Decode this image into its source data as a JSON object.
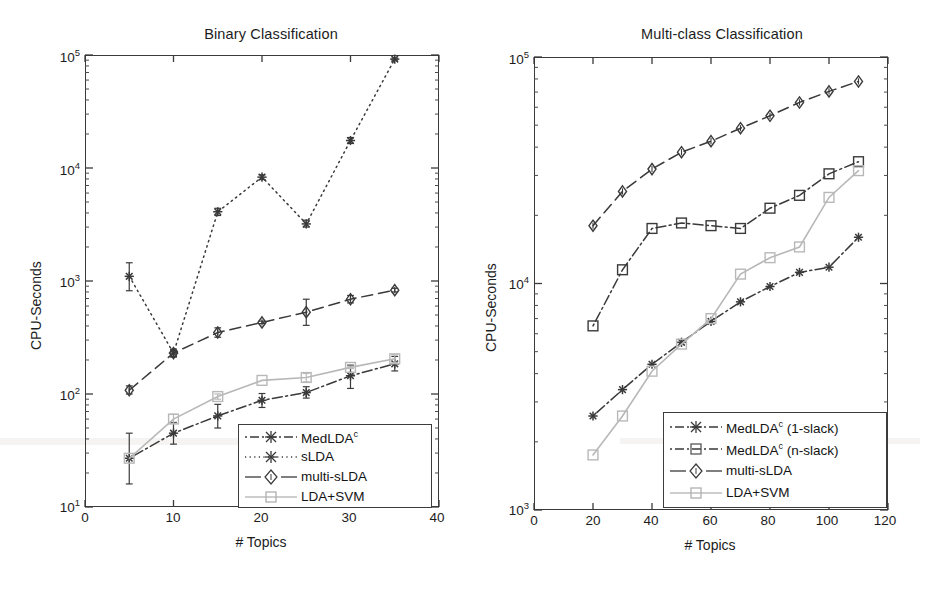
{
  "figure": {
    "background": "#ffffff",
    "ink": "#1a1a1a"
  },
  "panels": [
    {
      "id": "binary",
      "title": "Binary Classification",
      "xlabel": "# Topics",
      "ylabel": "CPU-Seconds",
      "xticks": [
        "0",
        "10",
        "20",
        "30",
        "40"
      ],
      "ytick_mantissa": [
        "10",
        "10",
        "10",
        "10",
        "10"
      ],
      "yticks_exp": [
        "1",
        "2",
        "3",
        "4",
        "5"
      ],
      "legend": [
        {
          "label": "MedLDA",
          "sup": "c",
          "style": "dashdot-asterisk",
          "color": "#3a3a3a"
        },
        {
          "label": "sLDA",
          "sup": "",
          "style": "dotted-asterisk",
          "color": "#3a3a3a"
        },
        {
          "label": "multi-sLDA",
          "sup": "",
          "style": "dashed-diamond",
          "color": "#3a3a3a"
        },
        {
          "label": "LDA+SVM",
          "sup": "",
          "style": "solid-square",
          "color": "#b8b8b8"
        }
      ]
    },
    {
      "id": "multiclass",
      "title": "Multi-class Classification",
      "xlabel": "# Topics",
      "ylabel": "CPU-Seconds",
      "xticks": [
        "0",
        "20",
        "40",
        "60",
        "80",
        "100",
        "120"
      ],
      "ytick_mantissa": [
        "10",
        "10",
        "10"
      ],
      "yticks_exp": [
        "3",
        "4",
        "5"
      ],
      "legend": [
        {
          "label": "MedLDA",
          "sup": "c",
          "suffix": " (1-slack)",
          "style": "dashdot-asterisk",
          "color": "#3a3a3a"
        },
        {
          "label": "MedLDA",
          "sup": "c",
          "suffix": " (n-slack)",
          "style": "dashdot-square",
          "color": "#3a3a3a"
        },
        {
          "label": "multi-sLDA",
          "sup": "",
          "suffix": "",
          "style": "dashed-diamond",
          "color": "#3a3a3a"
        },
        {
          "label": "LDA+SVM",
          "sup": "",
          "suffix": "",
          "style": "solid-square",
          "color": "#b8b8b8"
        }
      ]
    }
  ],
  "chart_data": [
    {
      "type": "line",
      "title": "Binary Classification",
      "xlabel": "# Topics",
      "ylabel": "CPU-Seconds",
      "yscale": "log",
      "xlim": [
        0,
        40
      ],
      "ylim": [
        10,
        100000
      ],
      "xticks": [
        0,
        10,
        20,
        30,
        40
      ],
      "yticks": [
        10,
        100,
        1000,
        10000,
        100000
      ],
      "grid": false,
      "legend_position": "lower-right-inside",
      "x": [
        5,
        10,
        15,
        20,
        25,
        30,
        35
      ],
      "series": [
        {
          "name": "MedLDA^c",
          "marker": "asterisk",
          "linestyle": "dashdot",
          "color": "#3a3a3a",
          "values": [
            27,
            45,
            64,
            88,
            103,
            145,
            185
          ],
          "err_low": [
            16,
            36,
            50,
            76,
            92,
            112,
            160
          ],
          "err_high": [
            45,
            56,
            81,
            101,
            116,
            180,
            215
          ]
        },
        {
          "name": "sLDA",
          "marker": "asterisk",
          "linestyle": "dotted",
          "color": "#3a3a3a",
          "values": [
            1100,
            230,
            4100,
            8300,
            3200,
            17500,
            92000
          ],
          "err_low": [
            820,
            215,
            3800,
            7900,
            3000,
            16500,
            90000
          ],
          "err_high": [
            1450,
            245,
            4400,
            8700,
            3450,
            18600,
            94000
          ]
        },
        {
          "name": "multi-sLDA",
          "marker": "diamond",
          "linestyle": "dashed",
          "color": "#3a3a3a",
          "values": [
            108,
            230,
            350,
            430,
            530,
            690,
            830
          ],
          "err_low": [
            100,
            212,
            318,
            420,
            405,
            640,
            800
          ],
          "err_high": [
            118,
            250,
            385,
            442,
            690,
            745,
            862
          ]
        },
        {
          "name": "LDA+SVM",
          "marker": "square",
          "linestyle": "solid",
          "color": "#b8b8b8",
          "values": [
            27,
            60,
            95,
            132,
            140,
            172,
            205
          ],
          "err_low": [
            27,
            55,
            90,
            132,
            128,
            168,
            190
          ],
          "err_high": [
            27,
            66,
            100,
            132,
            152,
            176,
            222
          ]
        }
      ]
    },
    {
      "type": "line",
      "title": "Multi-class Classification",
      "xlabel": "# Topics",
      "ylabel": "CPU-Seconds",
      "yscale": "log",
      "xlim": [
        0,
        120
      ],
      "ylim": [
        1000,
        100000
      ],
      "xticks": [
        0,
        20,
        40,
        60,
        80,
        100,
        120
      ],
      "yticks": [
        1000,
        10000,
        100000
      ],
      "grid": false,
      "legend_position": "lower-right-inside",
      "x": [
        20,
        30,
        40,
        50,
        60,
        70,
        80,
        90,
        100,
        110
      ],
      "series": [
        {
          "name": "MedLDA^c (1-slack)",
          "marker": "asterisk",
          "linestyle": "dashdot",
          "color": "#3a3a3a",
          "values": [
            2600,
            3400,
            4400,
            5500,
            6800,
            8300,
            9700,
            11200,
            11800,
            16000
          ]
        },
        {
          "name": "MedLDA^c (n-slack)",
          "marker": "square",
          "linestyle": "dashdot",
          "color": "#3a3a3a",
          "values": [
            6500,
            11500,
            17500,
            18500,
            18000,
            17500,
            21500,
            24500,
            30500,
            34500
          ]
        },
        {
          "name": "multi-sLDA",
          "marker": "diamond",
          "linestyle": "dashed",
          "color": "#3a3a3a",
          "values": [
            18000,
            25500,
            32000,
            38000,
            42500,
            48500,
            55000,
            63000,
            70500,
            78000
          ]
        },
        {
          "name": "LDA+SVM",
          "marker": "square",
          "linestyle": "solid",
          "color": "#b8b8b8",
          "values": [
            1750,
            2600,
            4100,
            5400,
            7000,
            11000,
            13000,
            14500,
            24000,
            31500
          ]
        }
      ]
    }
  ]
}
